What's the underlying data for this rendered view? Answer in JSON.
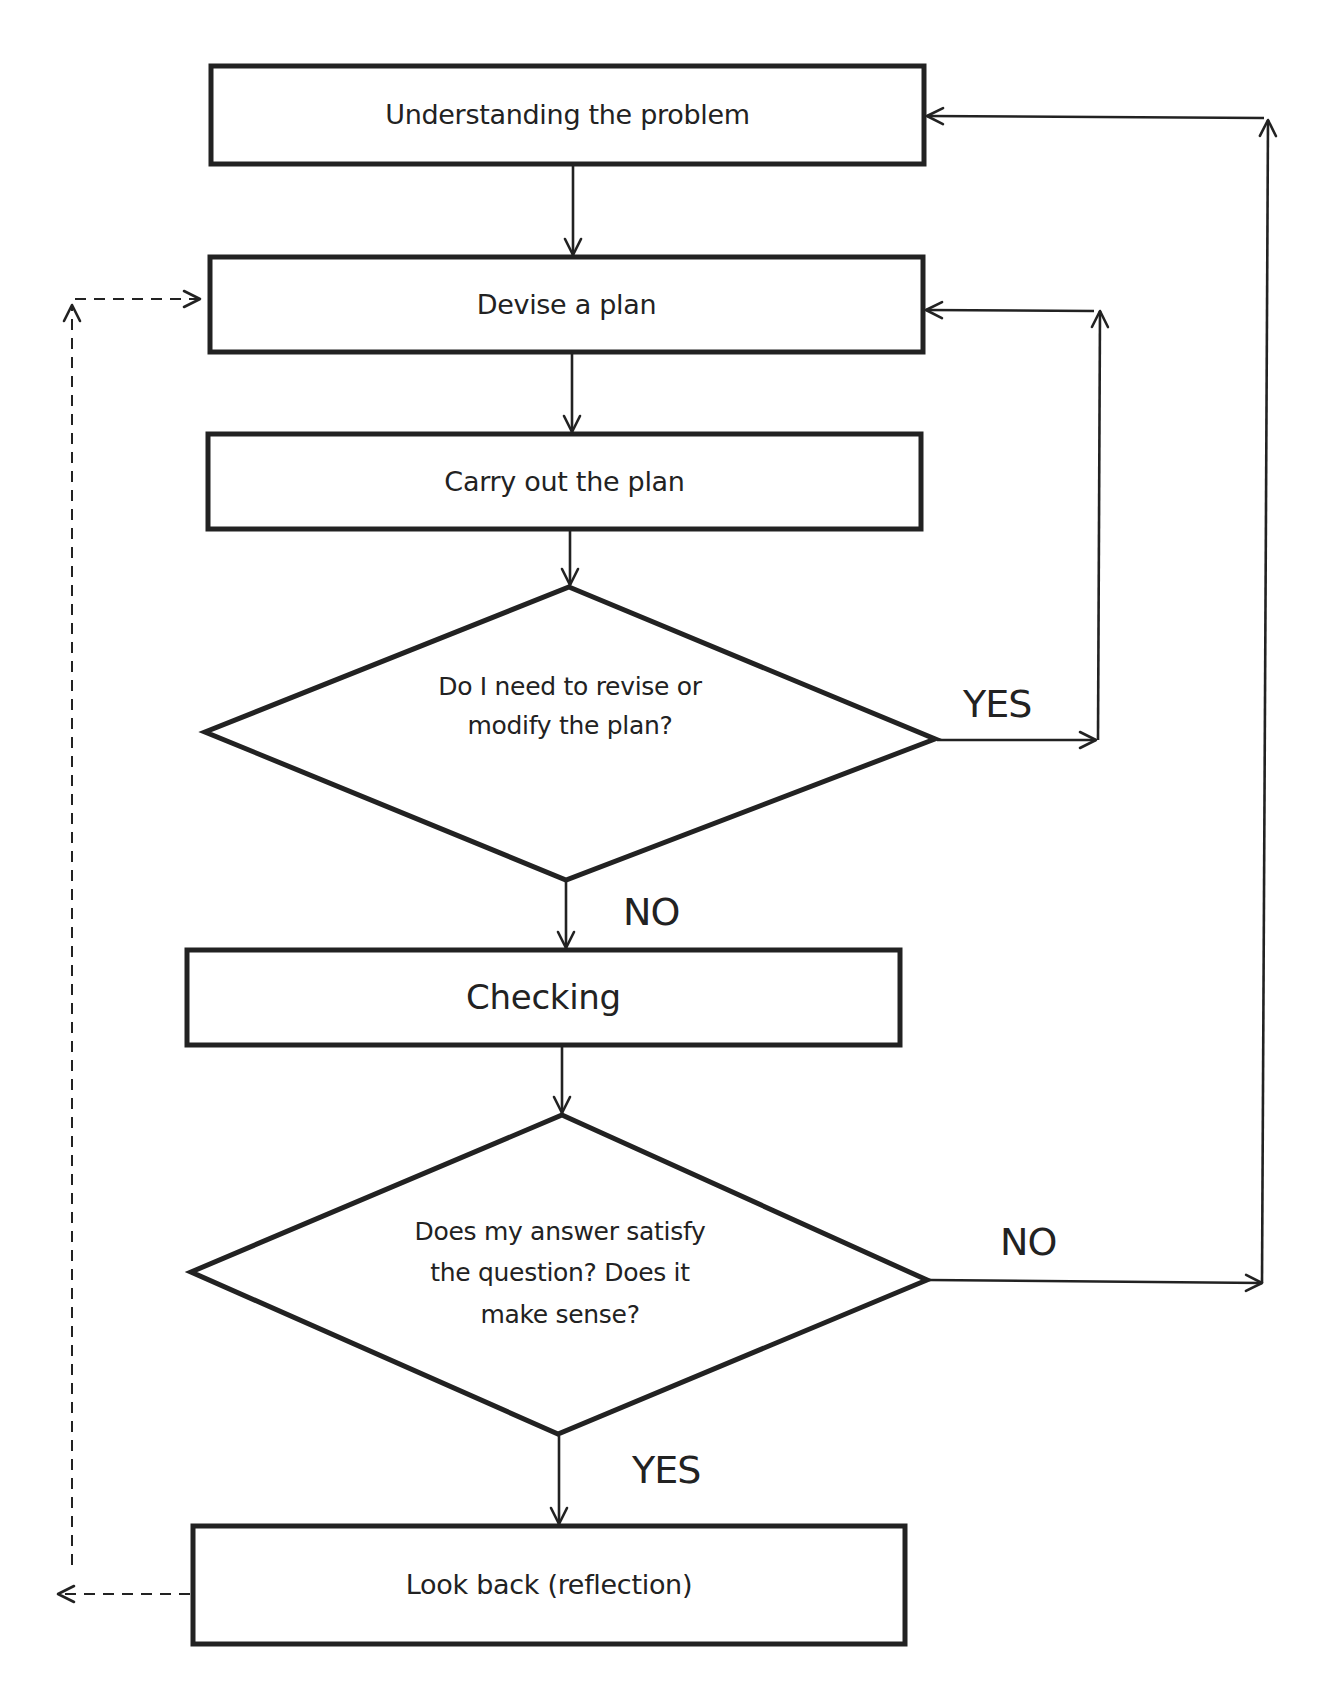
{
  "diagram": {
    "type": "flowchart",
    "colors": {
      "stroke": "#222222",
      "background": "#ffffff"
    },
    "nodes": {
      "understand": {
        "shape": "rectangle",
        "label": "Understanding the problem"
      },
      "devise": {
        "shape": "rectangle",
        "label": "Devise a plan"
      },
      "carry_out": {
        "shape": "rectangle",
        "label": "Carry out the plan"
      },
      "revise_decision": {
        "shape": "diamond",
        "lines": [
          "Do I need to revise or",
          "modify the plan?"
        ]
      },
      "checking": {
        "shape": "rectangle",
        "label": "Checking"
      },
      "satisfy_decision": {
        "shape": "diamond",
        "lines": [
          "Does my answer satisfy",
          "the question? Does it",
          "make sense?"
        ]
      },
      "look_back": {
        "shape": "rectangle",
        "label": "Look back (reflection)"
      }
    },
    "edge_labels": {
      "revise_yes": "YES",
      "revise_no": "NO",
      "satisfy_no": "NO",
      "satisfy_yes": "YES"
    },
    "edges": [
      {
        "from": "Understanding the problem",
        "to": "Devise a plan",
        "style": "solid"
      },
      {
        "from": "Devise a plan",
        "to": "Carry out the plan",
        "style": "solid"
      },
      {
        "from": "Carry out the plan",
        "to": "Do I need to revise or modify the plan?",
        "style": "solid"
      },
      {
        "from": "Do I need to revise or modify the plan?",
        "to": "Devise a plan",
        "label": "YES",
        "style": "solid"
      },
      {
        "from": "Do I need to revise or modify the plan?",
        "to": "Checking",
        "label": "NO",
        "style": "solid"
      },
      {
        "from": "Checking",
        "to": "Does my answer satisfy the question? Does it make sense?",
        "style": "solid"
      },
      {
        "from": "Does my answer satisfy the question? Does it make sense?",
        "to": "Understanding the problem",
        "label": "NO",
        "style": "solid"
      },
      {
        "from": "Does my answer satisfy the question? Does it make sense?",
        "to": "Look back (reflection)",
        "label": "YES",
        "style": "solid"
      },
      {
        "from": "Look back (reflection)",
        "to": "Devise a plan",
        "style": "dashed"
      }
    ]
  }
}
